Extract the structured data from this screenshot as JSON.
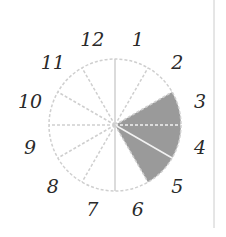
{
  "diagram": {
    "type": "clock-sector-diagram",
    "sectors": 12,
    "labels": [
      "12",
      "1",
      "2",
      "3",
      "4",
      "5",
      "6",
      "7",
      "8",
      "9",
      "10",
      "11"
    ],
    "shaded_sectors": [
      "3",
      "4",
      "5"
    ],
    "colors": {
      "shade": "#9a9a9a",
      "dashed_line": "#cfcfcf",
      "label": "#2a2a2a",
      "divider": "#cccccc"
    }
  }
}
